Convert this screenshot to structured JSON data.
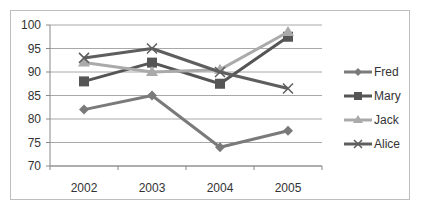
{
  "chart_data": {
    "type": "line",
    "title": "",
    "xlabel": "",
    "ylabel": "",
    "categories": [
      "2002",
      "2003",
      "2004",
      "2005"
    ],
    "ylim": [
      70,
      100
    ],
    "yticks": [
      70,
      75,
      80,
      85,
      90,
      95,
      100
    ],
    "grid": true,
    "legend_position": "right",
    "series": [
      {
        "name": "Fred",
        "marker": "diamond",
        "color": "#7a7a7a",
        "values": [
          82,
          85,
          74,
          77.5
        ]
      },
      {
        "name": "Mary",
        "marker": "square",
        "color": "#555555",
        "values": [
          88,
          92,
          87.5,
          97.5
        ]
      },
      {
        "name": "Jack",
        "marker": "triangle",
        "color": "#aaaaaa",
        "values": [
          92,
          90,
          90.5,
          98.5
        ]
      },
      {
        "name": "Alice",
        "marker": "x",
        "color": "#5e5e5e",
        "values": [
          93,
          95,
          90,
          86.5
        ]
      }
    ]
  }
}
